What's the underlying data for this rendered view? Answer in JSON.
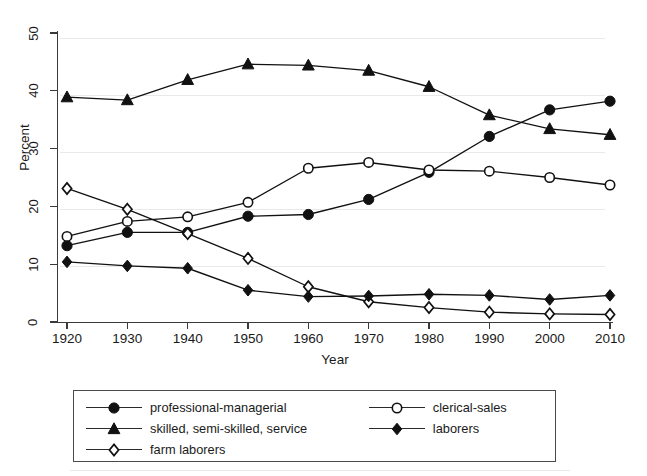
{
  "chart_data": {
    "type": "line",
    "title": "",
    "xlabel": "Year",
    "ylabel": "Percent",
    "x": [
      1920,
      1930,
      1940,
      1950,
      1960,
      1970,
      1980,
      1990,
      2000,
      2010
    ],
    "xtick_labels": [
      "1920",
      "1930",
      "1940",
      "1950",
      "1960",
      "1970",
      "1980",
      "1990",
      "2000",
      "2010"
    ],
    "ytick_labels": [
      "0",
      "10",
      "20",
      "30",
      "40",
      "50"
    ],
    "yticks": [
      0,
      10,
      20,
      30,
      40,
      50
    ],
    "xlim": [
      1920,
      2010
    ],
    "ylim": [
      0,
      50
    ],
    "grid": false,
    "legend_position": "below-plot",
    "series": [
      {
        "name": "professional-managerial",
        "marker": "filled-circle",
        "color": "#111111",
        "values": [
          13.2,
          15.5,
          15.5,
          18.3,
          18.6,
          21.2,
          25.9,
          32.1,
          36.7,
          38.2
        ]
      },
      {
        "name": "skilled, semi-skilled, service",
        "marker": "filled-triangle",
        "color": "#111111",
        "values": [
          38.9,
          38.4,
          41.9,
          44.6,
          44.4,
          43.5,
          40.7,
          35.8,
          33.4,
          32.4
        ]
      },
      {
        "name": "farm laborers",
        "marker": "open-diamond",
        "color": "#111111",
        "values": [
          23.1,
          19.5,
          15.3,
          11.0,
          6.1,
          3.5,
          2.5,
          1.7,
          1.4,
          1.3
        ]
      },
      {
        "name": "clerical-sales",
        "marker": "open-circle",
        "color": "#111111",
        "values": [
          14.8,
          17.4,
          18.2,
          20.7,
          26.6,
          27.6,
          26.3,
          26.1,
          25.0,
          23.7
        ]
      },
      {
        "name": "laborers",
        "marker": "filled-diamond",
        "color": "#111111",
        "values": [
          10.4,
          9.7,
          9.3,
          5.5,
          4.4,
          4.5,
          4.8,
          4.6,
          3.9,
          4.6
        ]
      }
    ]
  },
  "legend": {
    "rows": [
      [
        {
          "label": "professional-managerial",
          "marker": "filled-circle"
        },
        {
          "label": "clerical-sales",
          "marker": "open-circle"
        }
      ],
      [
        {
          "label": "skilled, semi-skilled, service",
          "marker": "filled-triangle"
        },
        {
          "label": "laborers",
          "marker": "filled-diamond"
        }
      ],
      [
        {
          "label": "farm laborers",
          "marker": "open-diamond"
        },
        {
          "label": "",
          "marker": "none"
        }
      ]
    ]
  },
  "axis": {
    "x_title": "Year",
    "y_title": "Percent"
  },
  "colors": {
    "ink": "#111111",
    "axis": "#3a3a3a",
    "background": "#ffffff"
  }
}
